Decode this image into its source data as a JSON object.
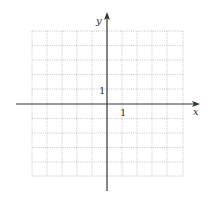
{
  "axes": {
    "x_label": "x",
    "y_label": "y",
    "x_tick_label": "1",
    "y_tick_label": "1"
  },
  "grid": {
    "cols": 10,
    "rows": 10,
    "x_range": [
      -5,
      5
    ],
    "y_range": [
      -5,
      5
    ],
    "line_style": "dotted",
    "line_color": "#b8b8b8",
    "axis_color": "#333333"
  }
}
